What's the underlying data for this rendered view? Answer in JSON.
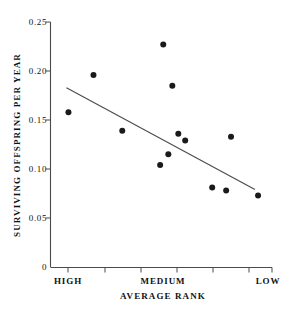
{
  "chart_data": {
    "type": "scatter",
    "title": "",
    "xlabel": "AVERAGE RANK",
    "ylabel": "SURVIVING OFFSPRING PER YEAR",
    "xlim": [
      0,
      1
    ],
    "ylim": [
      0,
      0.25
    ],
    "grid": false,
    "legend": "none",
    "x_tick_labels": [
      "HIGH",
      "MEDIUM",
      "LOW"
    ],
    "x_tick_positions": [
      0.08,
      0.5,
      0.97
    ],
    "x_minor_tick_positions": [
      0.08,
      0.24,
      0.4,
      0.56,
      0.72,
      0.88
    ],
    "y_tick_labels": [
      "0",
      "0.05",
      "0.10",
      "0.15",
      "0.20",
      "0.25"
    ],
    "y_tick_values": [
      0,
      0.05,
      0.1,
      0.15,
      0.2,
      0.25
    ],
    "points": [
      {
        "x": 0.081,
        "y": 0.158
      },
      {
        "x": 0.194,
        "y": 0.196
      },
      {
        "x": 0.324,
        "y": 0.139
      },
      {
        "x": 0.509,
        "y": 0.227
      },
      {
        "x": 0.55,
        "y": 0.185
      },
      {
        "x": 0.577,
        "y": 0.136
      },
      {
        "x": 0.608,
        "y": 0.129
      },
      {
        "x": 0.532,
        "y": 0.115
      },
      {
        "x": 0.495,
        "y": 0.104
      },
      {
        "x": 0.73,
        "y": 0.081
      },
      {
        "x": 0.793,
        "y": 0.078
      },
      {
        "x": 0.815,
        "y": 0.133
      },
      {
        "x": 0.937,
        "y": 0.073
      }
    ],
    "trend_line": {
      "x1": 0.072,
      "y1": 0.183,
      "x2": 0.923,
      "y2": 0.079
    },
    "marker": {
      "shape": "circle",
      "size_px": 6,
      "color": "#1a1a1a"
    },
    "line_color": "#4a4a4a",
    "axis_color": "#4a4a4a",
    "background_color": "#ffffff"
  },
  "axes": {
    "y_title": "SURVIVING OFFSPRING PER YEAR",
    "x_title": "AVERAGE RANK"
  }
}
